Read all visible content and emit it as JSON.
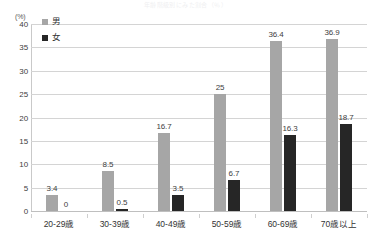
{
  "chart_data": {
    "type": "bar",
    "title": "年齢階級別にみた割合（％）",
    "subtitle": "",
    "xlabel": "",
    "ylabel": "(%)",
    "unit_label": "(%)",
    "categories": [
      "20-29歳",
      "30-39歳",
      "40-49歳",
      "50-59歳",
      "60-69歳",
      "70歳以上"
    ],
    "series": [
      {
        "name": "男",
        "color": "#a6a6a6",
        "values": [
          3.4,
          8.5,
          16.7,
          25,
          36.4,
          36.9
        ],
        "labels": [
          "3.4",
          "8.5",
          "16.7",
          "25",
          "36.4",
          "36.9"
        ]
      },
      {
        "name": "女",
        "color": "#262626",
        "values": [
          0,
          0.5,
          3.5,
          6.7,
          16.3,
          18.7
        ],
        "labels": [
          "0",
          "0.5",
          "3.5",
          "6.7",
          "16.3",
          "18.7"
        ]
      }
    ],
    "ylim": [
      0,
      40
    ],
    "ytick_step": 5,
    "yticks": [
      "0",
      "5",
      "10",
      "15",
      "20",
      "25",
      "30",
      "35",
      "40"
    ],
    "grid": true,
    "legend_position": "top-left"
  },
  "legend": {
    "items": [
      {
        "label": "男",
        "color": "#a6a6a6"
      },
      {
        "label": "女",
        "color": "#262626"
      }
    ]
  },
  "colors": {
    "male": "#a6a6a6",
    "female": "#262626",
    "grid": "#d4d4d4",
    "text": "#404040"
  }
}
